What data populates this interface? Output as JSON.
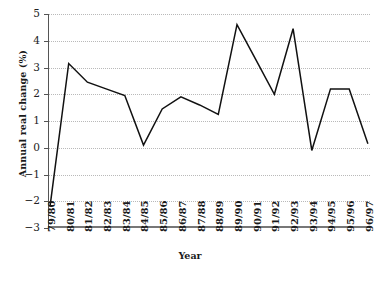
{
  "chart_data": {
    "type": "line",
    "title": "",
    "xlabel": "Year",
    "ylabel": "Annual real change (%)",
    "categories": [
      "79/80",
      "80/81",
      "81/82",
      "82/83",
      "83/84",
      "84/85",
      "85/86",
      "86/87",
      "87/88",
      "88/89",
      "89/90",
      "90/91",
      "91/92",
      "92/93",
      "93/94",
      "94/95",
      "95/96",
      "96/97"
    ],
    "values": [
      -2.2,
      3.15,
      2.45,
      2.2,
      1.95,
      0.1,
      1.45,
      1.9,
      1.6,
      1.25,
      4.6,
      3.3,
      2.0,
      4.45,
      -0.1,
      2.2,
      2.2,
      0.15
    ],
    "series": [
      {
        "name": "Annual real change",
        "values": [
          -2.2,
          3.15,
          2.45,
          2.2,
          1.95,
          0.1,
          1.45,
          1.9,
          1.6,
          1.25,
          4.6,
          3.3,
          2.0,
          4.45,
          -0.1,
          2.2,
          2.2,
          0.15
        ]
      }
    ],
    "ylim": [
      -3,
      5
    ],
    "yticks": [
      5,
      4,
      3,
      2,
      1,
      0,
      -1,
      -2,
      -3
    ],
    "ytick_labels": [
      "5",
      "4",
      "3",
      "2",
      "1",
      "0",
      "−1",
      "−2",
      "−3"
    ],
    "grid": true,
    "grid_style": "dotted",
    "grid_color": "#b9b9b9",
    "legend": "none",
    "line_color": "#111111",
    "axis_color": "#555555"
  }
}
